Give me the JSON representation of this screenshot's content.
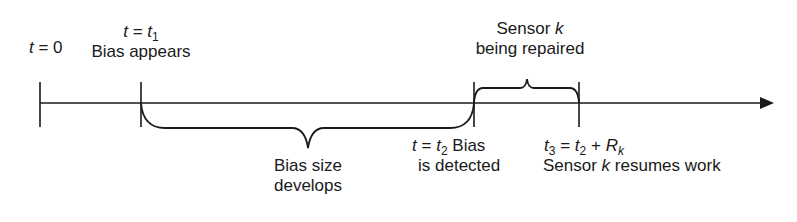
{
  "diagram": {
    "type": "timeline",
    "axis": {
      "direction": "right",
      "arrow": true
    },
    "events": [
      {
        "id": "t0",
        "time_var": "t",
        "eq": "= 0",
        "description": ""
      },
      {
        "id": "t1",
        "time_var": "t",
        "eq": "=",
        "sym": "t",
        "sub": "1",
        "description": "Bias appears"
      },
      {
        "id": "t2",
        "time_var": "t",
        "eq": "=",
        "sym": "t",
        "sub": "2",
        "description_line1": "Bias",
        "description_line2": "is detected"
      },
      {
        "id": "t3",
        "sym": "t",
        "sub": "3",
        "eq": "=",
        "rhs_sym": "t",
        "rhs_sub": "2",
        "plus": "+",
        "rhs2_sym": "R",
        "rhs2_sub": "k",
        "description_pre": "Sensor",
        "description_k": "k",
        "description_post": "resumes work"
      }
    ],
    "intervals": [
      {
        "from": "t1",
        "to": "t2",
        "line1": "Bias size",
        "line2": "develops",
        "brace": "below"
      },
      {
        "from": "t2",
        "to": "t3",
        "line1_pre": "Sensor",
        "line1_k": "k",
        "line2": "being repaired",
        "brace": "above"
      }
    ],
    "colors": {
      "line": "#1a1a1a",
      "background": "#ffffff"
    }
  }
}
